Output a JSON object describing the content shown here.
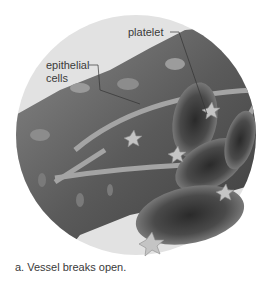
{
  "figure": {
    "labels": {
      "platelet": "platelet",
      "epithelial_line1": "epithelial",
      "epithelial_line2": "cells"
    },
    "caption": "a. Vessel breaks open.",
    "colors": {
      "background": "#ffffff",
      "circle": "#e2e2e2",
      "tissue_dark": "#3c3c3c",
      "tissue_mid": "#6e6e6e",
      "tissue_light": "#9a9a9a",
      "platelet": "#c8c8c8",
      "label_text": "#3a3a3a"
    }
  }
}
